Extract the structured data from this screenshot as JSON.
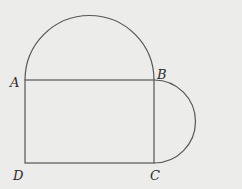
{
  "diagram": {
    "type": "geometry-figure",
    "points": {
      "A": {
        "label": "A",
        "x": 25,
        "y": 80
      },
      "B": {
        "label": "B",
        "x": 154,
        "y": 80
      },
      "C": {
        "label": "C",
        "x": 154,
        "y": 163
      },
      "D": {
        "label": "D",
        "x": 25,
        "y": 163
      }
    },
    "shapes": [
      {
        "type": "rectangle",
        "vertices": [
          "A",
          "B",
          "C",
          "D"
        ]
      },
      {
        "type": "semicircle",
        "diameter": [
          "A",
          "B"
        ],
        "side": "outside-top"
      },
      {
        "type": "semicircle",
        "diameter": [
          "B",
          "C"
        ],
        "side": "outside-right"
      }
    ],
    "colors": {
      "stroke": "#555555",
      "background": "#ececea",
      "label": "#2b2b2b"
    }
  }
}
